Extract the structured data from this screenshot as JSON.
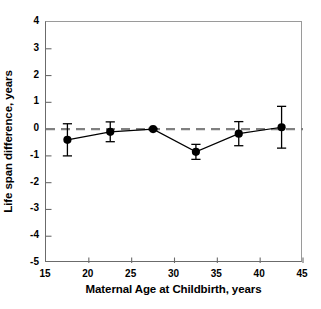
{
  "figure": {
    "top_clipped_caption": "— — — — —"
  },
  "chart_data": {
    "type": "line",
    "title": "",
    "xlabel": "Maternal Age at Childbirth, years",
    "ylabel": "Life span difference, years",
    "xlim": [
      15,
      45
    ],
    "ylim": [
      -5,
      4
    ],
    "xticks": [
      15,
      20,
      25,
      30,
      35,
      40,
      45
    ],
    "xtick_labels": [
      "15",
      "20",
      "25",
      "30",
      "35",
      "40",
      "45"
    ],
    "yticks": [
      4,
      3,
      2,
      1,
      0,
      -1,
      -2,
      -3,
      -4,
      -5
    ],
    "ytick_labels": [
      "4",
      "3",
      "2",
      "1",
      "0",
      "-1",
      "-2",
      "-3",
      "-4",
      "-5"
    ],
    "grid": false,
    "legend": null,
    "reference_line": {
      "y": 0,
      "style": "dashed",
      "color": "#808080",
      "label": "zero difference"
    },
    "x": [
      17.5,
      22.5,
      27.5,
      32.5,
      37.5,
      42.5
    ],
    "values": [
      -0.4,
      -0.1,
      0.0,
      -0.85,
      -0.17,
      0.07
    ],
    "yerr": [
      0.6,
      0.37,
      0.03,
      0.28,
      0.45,
      0.78
    ],
    "series": [
      {
        "name": "Life span difference",
        "marker": "filled-circle",
        "line_color": "#000000",
        "x": [
          17.5,
          22.5,
          27.5,
          32.5,
          37.5,
          42.5
        ],
        "values": [
          -0.4,
          -0.1,
          0.0,
          -0.85,
          -0.17,
          0.07
        ],
        "yerr": [
          0.6,
          0.37,
          0.03,
          0.28,
          0.45,
          0.78
        ]
      }
    ],
    "colors": {
      "axis": "#6b6b6b",
      "data": "#000000",
      "reference": "#808080"
    }
  }
}
